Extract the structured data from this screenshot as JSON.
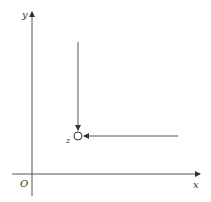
{
  "diagram": {
    "axes": {
      "x_label": "x",
      "y_label": "y",
      "origin_label": "O"
    },
    "point": {
      "label": "z",
      "marker": "open-circle"
    },
    "arrows": [
      {
        "name": "vertical-approach-arrow",
        "direction": "down",
        "description": "approaches z from above"
      },
      {
        "name": "horizontal-approach-arrow",
        "direction": "left",
        "description": "approaches z from the right"
      }
    ],
    "colors": {
      "stroke": "#555555",
      "text": "#333333",
      "background": "#ffffff"
    }
  }
}
